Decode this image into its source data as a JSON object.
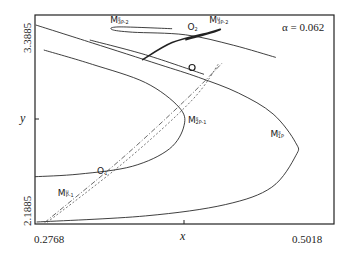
{
  "chart_data": {
    "type": "line",
    "title": "",
    "annotation": "α = 0.062",
    "xlabel": "x",
    "ylabel": "y",
    "xlim": [
      0.2768,
      0.5018
    ],
    "ylim": [
      2.1885,
      3.3885
    ],
    "x_ticks": [
      "0.2768",
      "0.5018"
    ],
    "y_ticks": [
      "2.1885",
      "3.3885"
    ],
    "grid": false,
    "series": [
      {
        "name": "M1P-s outer curve",
        "style": "solid",
        "points": [
          [
            0.2774,
            3.3313
          ],
          [
            0.32,
            3.228
          ],
          [
            0.37,
            3.105
          ],
          [
            0.4,
            3.03
          ],
          [
            0.43,
            2.94
          ],
          [
            0.456,
            2.82
          ],
          [
            0.473,
            2.655
          ],
          [
            0.473,
            2.58
          ],
          [
            0.455,
            2.4
          ],
          [
            0.42,
            2.3
          ],
          [
            0.36,
            2.235
          ],
          [
            0.278,
            2.2
          ]
        ]
      },
      {
        "name": "M2P-1 inner curve",
        "style": "solid",
        "points": [
          [
            0.2834,
            3.1875
          ],
          [
            0.32,
            3.105
          ],
          [
            0.36,
            3.0
          ],
          [
            0.385,
            2.86
          ],
          [
            0.389,
            2.755
          ],
          [
            0.378,
            2.62
          ],
          [
            0.35,
            2.52
          ],
          [
            0.31,
            2.475
          ],
          [
            0.2768,
            2.46
          ]
        ]
      },
      {
        "name": "M3P-2 loop",
        "style": "solid",
        "points": [
          [
            0.38,
            3.31
          ],
          [
            0.34,
            3.32
          ],
          [
            0.335,
            3.304
          ],
          [
            0.35,
            3.29
          ],
          [
            0.39,
            3.275
          ],
          [
            0.426,
            3.215
          ],
          [
            0.458,
            3.145
          ]
        ]
      },
      {
        "name": "parallel line",
        "style": "solid",
        "points": [
          [
            0.318,
            3.245
          ],
          [
            0.36,
            3.16
          ],
          [
            0.404,
            3.048
          ]
        ]
      },
      {
        "name": "O2 branch (thick)",
        "style": "thick",
        "points": [
          [
            0.3575,
            3.13
          ],
          [
            0.38,
            3.23
          ],
          [
            0.408,
            3.288
          ],
          [
            0.416,
            3.306
          ],
          [
            0.412,
            3.292
          ],
          [
            0.39,
            3.245
          ]
        ]
      },
      {
        "name": "M1P-1 dash-dot",
        "style": "dashdot",
        "points": [
          [
            0.284,
            2.1965
          ],
          [
            0.34,
            2.55
          ],
          [
            0.39,
            2.9
          ],
          [
            0.418,
            3.115
          ]
        ]
      },
      {
        "name": "M1P-1 dashed",
        "style": "dashed",
        "points": [
          [
            0.286,
            2.198
          ],
          [
            0.345,
            2.55
          ],
          [
            0.395,
            2.9
          ],
          [
            0.415,
            3.11
          ]
        ]
      }
    ],
    "points": [
      {
        "label": "O",
        "sub": "",
        "x": 0.395,
        "y": 3.087
      },
      {
        "label": "O",
        "sub": "1",
        "x": 0.3235,
        "y": 2.474
      },
      {
        "label": "O",
        "sub": "2",
        "x": 0.3915,
        "y": 3.3
      }
    ],
    "labels": [
      {
        "text": "M",
        "sup": "s",
        "sub": "3P-2",
        "x": 0.3335,
        "y": 3.34
      },
      {
        "text": "M",
        "sup": "u",
        "sub": "3P-2",
        "x": 0.408,
        "y": 3.34
      },
      {
        "text": "M",
        "sup": "s",
        "sub": "2P-1",
        "x": 0.392,
        "y": 2.77
      },
      {
        "text": "M",
        "sup": "s",
        "sub": "1P",
        "x": 0.454,
        "y": 2.69
      },
      {
        "text": "M",
        "sup": "u",
        "sub": "P-1",
        "x": 0.294,
        "y": 2.35
      }
    ]
  }
}
